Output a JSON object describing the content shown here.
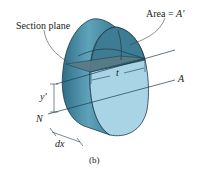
{
  "figure": {
    "caption": "(b)",
    "labels": {
      "section_plane": "Section plane",
      "area": "Area = ",
      "area_symbol": "A'",
      "thickness": "t",
      "axis_A": "A",
      "axis_N": "N",
      "y_prime": "y'",
      "dx": "dx"
    },
    "colors": {
      "body_side": "#5b9db5",
      "body_side_dark": "#2f6f86",
      "front_face": "#a9d4e6",
      "cap_region": "#3d7c92",
      "section_plane": "#5a7a86",
      "outline": "#1d3b48",
      "leader": "#444444"
    }
  }
}
